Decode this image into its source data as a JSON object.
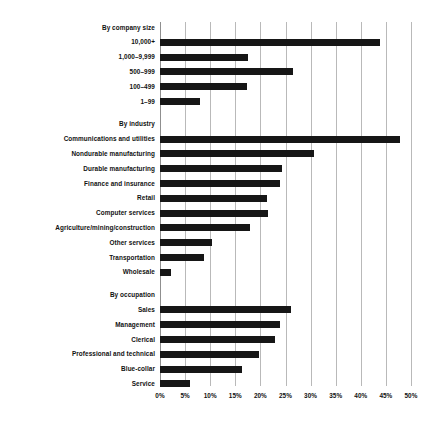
{
  "chart_data": {
    "type": "bar",
    "title": "",
    "xlabel": "",
    "ylabel": "",
    "orientation": "horizontal",
    "grid": true,
    "legend": null,
    "xlim": [
      0,
      50
    ],
    "xtick_labels": [
      "0%",
      "5%",
      "10%",
      "15%",
      "20%",
      "25%",
      "30%",
      "35%",
      "40%",
      "45%",
      "50%"
    ],
    "xtick_values": [
      0,
      5,
      10,
      15,
      20,
      25,
      30,
      35,
      40,
      45,
      50
    ],
    "unit": "%",
    "bar_color": "#161616",
    "grid_color": "#b9b9b9",
    "sections": [
      {
        "heading": "By company size",
        "categories": [
          "10,000+",
          "1,000–9,999",
          "500–999",
          "100–499",
          "1–99"
        ],
        "values": [
          43.8,
          17.5,
          26.5,
          17.3,
          8.0
        ]
      },
      {
        "heading": "By industry",
        "categories": [
          "Communications and utilities",
          "Nondurable manufacturing",
          "Durable manufacturing",
          "Finance and insurance",
          "Retail",
          "Computer services",
          "Agriculture/mining/construction",
          "Other services",
          "Transportation",
          "Wholesale"
        ],
        "values": [
          47.8,
          30.7,
          24.3,
          23.9,
          21.3,
          21.5,
          17.9,
          10.4,
          8.8,
          2.2
        ]
      },
      {
        "heading": "By occupation",
        "categories": [
          "Sales",
          "Management",
          "Clerical",
          "Professional and technical",
          "Blue-collar",
          "Service"
        ],
        "values": [
          26.1,
          23.9,
          22.9,
          19.7,
          16.3,
          5.9
        ]
      }
    ]
  }
}
